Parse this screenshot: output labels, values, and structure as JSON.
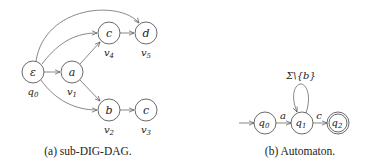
{
  "figure_a": {
    "caption": "(a) sub-DIG-DAG.",
    "nodes": [
      {
        "id": "q0",
        "symbol": "ε",
        "label_base": "q",
        "label_sub": "0"
      },
      {
        "id": "v1",
        "symbol": "a",
        "label_base": "v",
        "label_sub": "1"
      },
      {
        "id": "v4",
        "symbol": "c",
        "label_base": "v",
        "label_sub": "4"
      },
      {
        "id": "v5",
        "symbol": "d",
        "label_base": "v",
        "label_sub": "5"
      },
      {
        "id": "v2",
        "symbol": "b",
        "label_base": "v",
        "label_sub": "2"
      },
      {
        "id": "v3",
        "symbol": "c",
        "label_base": "v",
        "label_sub": "3"
      }
    ],
    "edges": [
      [
        "q0",
        "v1"
      ],
      [
        "q0",
        "v4"
      ],
      [
        "q0",
        "v5"
      ],
      [
        "q0",
        "v2"
      ],
      [
        "v1",
        "v4"
      ],
      [
        "v1",
        "v2"
      ],
      [
        "v4",
        "v5"
      ],
      [
        "v2",
        "v3"
      ]
    ]
  },
  "figure_b": {
    "caption": "(b) Automaton.",
    "states": [
      {
        "id": "q0",
        "base": "q",
        "sub": "0",
        "initial": true,
        "accepting": false
      },
      {
        "id": "q1",
        "base": "q",
        "sub": "1",
        "initial": false,
        "accepting": false
      },
      {
        "id": "q2",
        "base": "q",
        "sub": "2",
        "initial": false,
        "accepting": true
      }
    ],
    "transitions": [
      {
        "from": "q0",
        "to": "q1",
        "label": "a"
      },
      {
        "from": "q1",
        "to": "q1",
        "label": "Σ\\{b}"
      },
      {
        "from": "q1",
        "to": "q2",
        "label": "c"
      }
    ]
  }
}
